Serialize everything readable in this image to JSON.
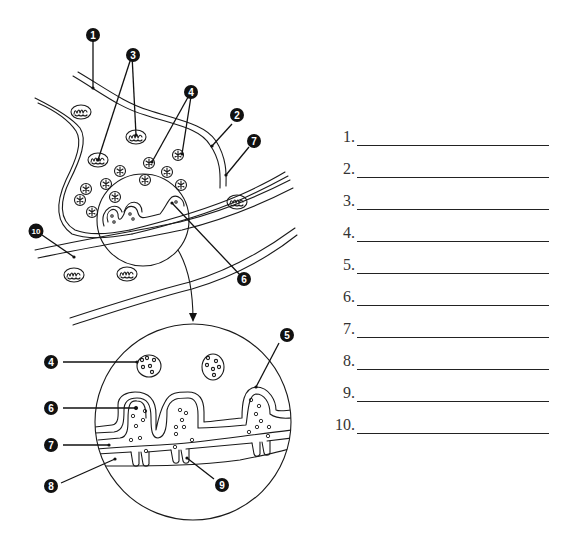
{
  "diagram": {
    "callouts": [
      {
        "id": "1",
        "label": "1"
      },
      {
        "id": "2",
        "label": "2"
      },
      {
        "id": "3",
        "label": "3"
      },
      {
        "id": "4",
        "label": "4"
      },
      {
        "id": "5",
        "label": "5"
      },
      {
        "id": "6",
        "label": "6"
      },
      {
        "id": "7",
        "label": "7"
      },
      {
        "id": "8",
        "label": "8"
      },
      {
        "id": "9",
        "label": "9"
      },
      {
        "id": "10",
        "label": "10"
      }
    ],
    "detail_callouts": {
      "c4": "4",
      "c5": "5",
      "c6": "6",
      "c7": "7",
      "c8": "8",
      "c9": "9"
    }
  },
  "answers": {
    "items": [
      {
        "number": "1.",
        "value": ""
      },
      {
        "number": "2.",
        "value": ""
      },
      {
        "number": "3.",
        "value": ""
      },
      {
        "number": "4.",
        "value": ""
      },
      {
        "number": "5.",
        "value": ""
      },
      {
        "number": "6.",
        "value": ""
      },
      {
        "number": "7.",
        "value": ""
      },
      {
        "number": "8.",
        "value": ""
      },
      {
        "number": "9.",
        "value": ""
      },
      {
        "number": "10.",
        "value": ""
      }
    ]
  }
}
